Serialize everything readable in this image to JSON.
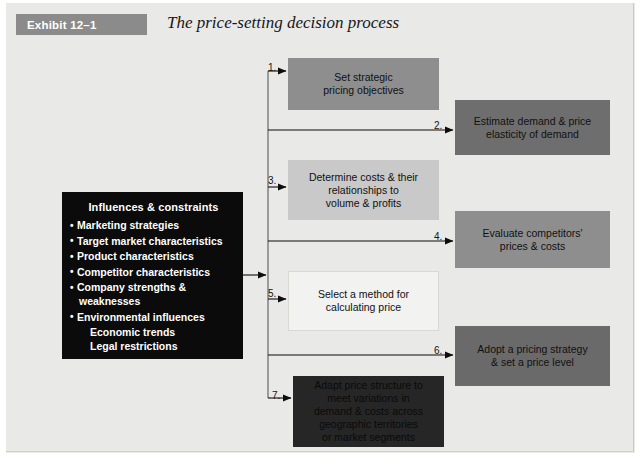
{
  "exhibit": {
    "tag": "Exhibit 12–1",
    "title": "The price-setting decision process"
  },
  "influences": {
    "heading": "Influences & constraints",
    "items": [
      "Marketing strategies",
      "Target market characteristics",
      "Product characteristics",
      "Competitor characteristics",
      "Company strengths &",
      "Environmental influences"
    ],
    "wrap_company": "weaknesses",
    "sub_items": [
      "Economic trends",
      "Legal restrictions"
    ]
  },
  "steps": [
    {
      "number": "1.",
      "text": "Set strategic\npricing objectives",
      "color": "#8e8e8e"
    },
    {
      "number": "2.",
      "text": "Estimate demand & price\nelasticity of demand",
      "color": "#6e6e6e"
    },
    {
      "number": "3.",
      "text": "Determine costs & their\nrelationships to\nvolume & profits",
      "color": "#c9c9c9"
    },
    {
      "number": "4.",
      "text": "Evaluate competitors'\nprices & costs",
      "color": "#8e8e8e"
    },
    {
      "number": "5.",
      "text": "Select a method for\ncalculating price",
      "color": "#f2f2f0"
    },
    {
      "number": "6.",
      "text": "Adopt a pricing strategy\n& set a price level",
      "color": "#6a6a6a"
    },
    {
      "number": "7.",
      "text": "Adapt price structure to\nmeet variations in\ndemand & costs across\ngeographic territories\nor market segments",
      "color": "#262626"
    }
  ],
  "chart_data": {
    "type": "diagram",
    "title": "The price-setting decision process",
    "nodes": [
      "Influences & constraints",
      "1. Set strategic pricing objectives",
      "2. Estimate demand & price elasticity of demand",
      "3. Determine costs & their relationships to volume & profits",
      "4. Evaluate competitors' prices & costs",
      "5. Select a method for calculating price",
      "6. Adopt a pricing strategy & set a price level",
      "7. Adapt price structure to meet variations in demand & costs across geographic territories or market segments"
    ],
    "edges": [
      {
        "from": "Influences & constraints",
        "to": "trunk"
      },
      {
        "from": "trunk",
        "to": "1. Set strategic pricing objectives"
      },
      {
        "from": "trunk",
        "to": "2. Estimate demand & price elasticity of demand"
      },
      {
        "from": "trunk",
        "to": "3. Determine costs & their relationships to volume & profits"
      },
      {
        "from": "trunk",
        "to": "4. Evaluate competitors' prices & costs"
      },
      {
        "from": "trunk",
        "to": "5. Select a method for calculating price"
      },
      {
        "from": "trunk",
        "to": "6. Adopt a pricing strategy & set a price level"
      },
      {
        "from": "trunk",
        "to": "7. Adapt price structure to meet variations in demand & costs across geographic territories or market segments"
      }
    ]
  }
}
